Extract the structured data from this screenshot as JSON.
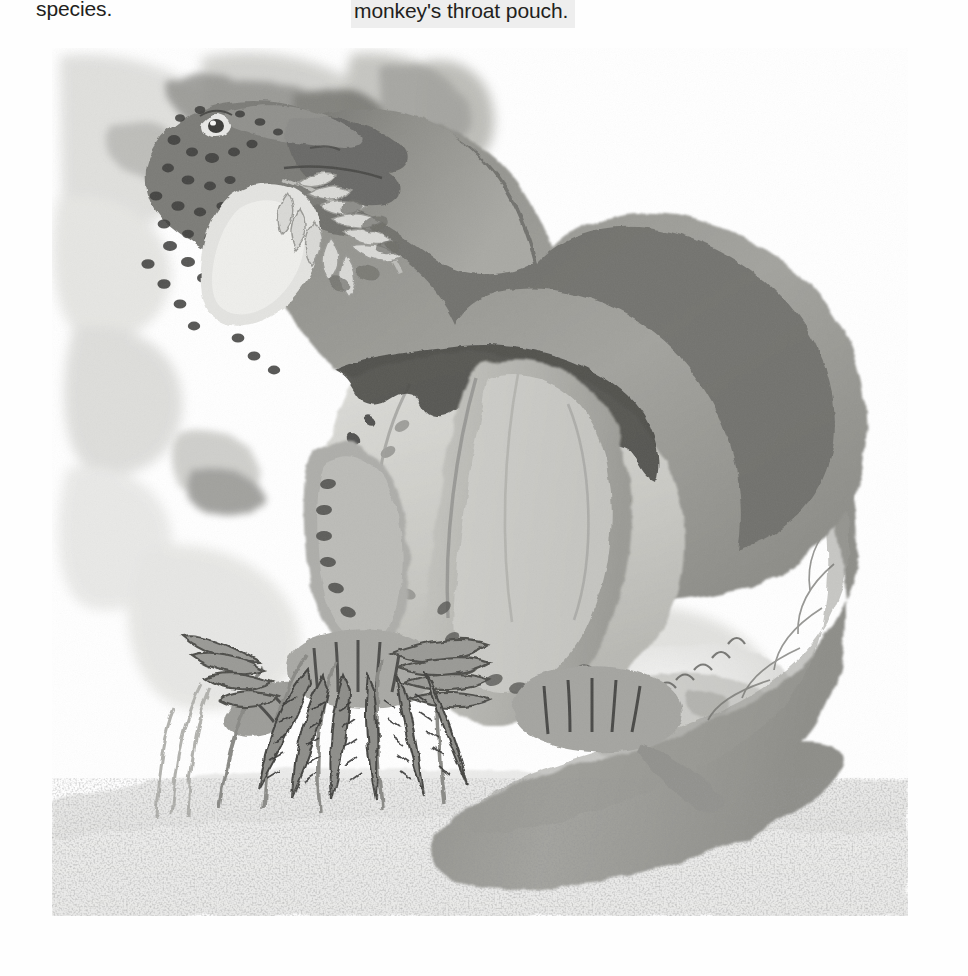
{
  "page": {
    "background_color": "#fefefe",
    "columns": [
      {
        "id": "left",
        "text": "species."
      },
      {
        "id": "right",
        "text": "monkey's throat pouch.",
        "highlight_color": "#eeeeee"
      }
    ]
  },
  "figure": {
    "name": "dinosaur-watercolor-illustration",
    "medium": "grayscale watercolor painting",
    "caption": "",
    "palette": {
      "paper": "#ffffff",
      "wash_lightest": "#f2f2f1",
      "wash_light": "#e3e3e1",
      "wash_mid_light": "#cfcfcc",
      "wash_mid": "#b4b4b0",
      "wash_mid_dark": "#9a9a96",
      "wash_dark": "#7d7d79",
      "wash_darker": "#5e5e5b",
      "ink": "#3a3a38",
      "ink_deep": "#232322"
    },
    "elements": [
      {
        "name": "background-foliage-wash",
        "label": "mottled grey background washes"
      },
      {
        "name": "dinosaur-head",
        "label": "spotted head with open beak"
      },
      {
        "name": "dinosaur-eye",
        "label": "eye"
      },
      {
        "name": "dinosaur-neck",
        "label": "long arched neck with dark dorsal spots"
      },
      {
        "name": "dinosaur-throat-pouch",
        "label": "pale throat pouch"
      },
      {
        "name": "fern-frond-in-mouth",
        "label": "fern frond being eaten"
      },
      {
        "name": "dinosaur-back",
        "label": "dark dorsal back"
      },
      {
        "name": "dinosaur-belly",
        "label": "pale speckled belly"
      },
      {
        "name": "dinosaur-foreleg",
        "label": "foreleg with banded toes"
      },
      {
        "name": "dinosaur-hindleg",
        "label": "thick hind leg"
      },
      {
        "name": "dinosaur-feet",
        "label": "striped clawed feet"
      },
      {
        "name": "dinosaur-tail",
        "label": "long tapering curled tail"
      },
      {
        "name": "foreground-ferns",
        "label": "cluster of fern fronds"
      },
      {
        "name": "reeds",
        "label": "thin reeds"
      },
      {
        "name": "sandy-ground",
        "label": "speckled sandy ground"
      },
      {
        "name": "rock-outcrop",
        "label": "pale rock outcrop"
      }
    ]
  }
}
